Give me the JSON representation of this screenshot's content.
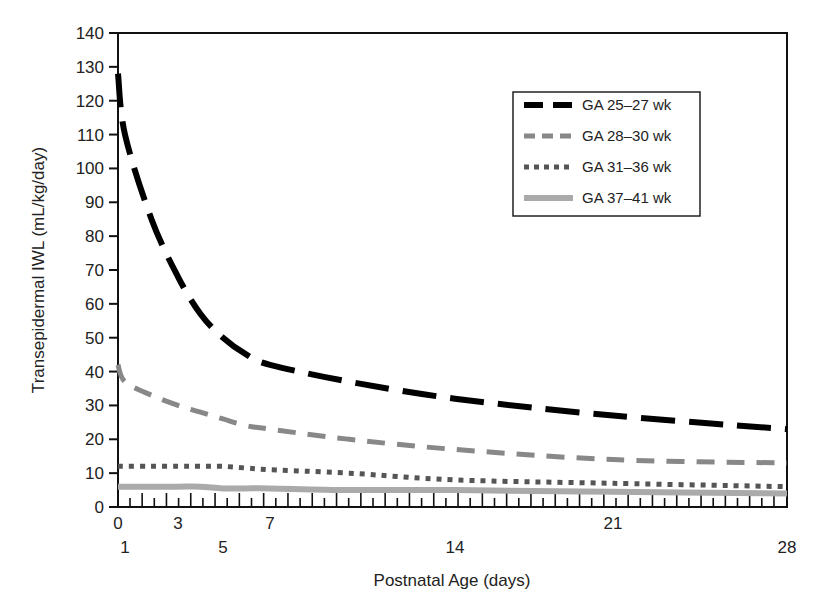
{
  "chart_data": {
    "type": "line",
    "title": "",
    "xlabel": "Postnatal Age (days)",
    "ylabel": "Transepidermal IWL (mL/kg/day)",
    "xlim": [
      0,
      28
    ],
    "ylim": [
      0,
      140
    ],
    "y_ticks": [
      0,
      10,
      20,
      30,
      40,
      50,
      60,
      70,
      80,
      90,
      100,
      110,
      120,
      130,
      140
    ],
    "x_tick_labels_row1": [
      "0",
      "3",
      "7",
      "21"
    ],
    "x_tick_labels_row2": [
      "1",
      "5",
      "14",
      "28"
    ],
    "x_tick_label_days_row1": [
      0,
      3,
      7,
      21
    ],
    "x_tick_label_days_row2": [
      1,
      5,
      14,
      28
    ],
    "grid": false,
    "legend_position": "upper right",
    "x": [
      0,
      1,
      2,
      3,
      4,
      5,
      6,
      7,
      10,
      14,
      21,
      28
    ],
    "series": [
      {
        "name": "GA 25–27 wk",
        "style": "long-dash",
        "color": "#000000",
        "values": [
          128,
          110,
          85,
          68,
          57,
          50,
          45,
          42,
          37,
          32,
          27,
          23
        ]
      },
      {
        "name": "GA 28–30 wk",
        "style": "dash",
        "color": "#888888",
        "values": [
          42,
          37,
          33,
          30,
          28,
          26,
          24,
          23,
          20,
          17,
          14,
          13
        ]
      },
      {
        "name": "GA 31–36 wk",
        "style": "dot",
        "color": "#555555",
        "values": [
          12,
          12,
          12,
          12,
          12,
          12,
          11.5,
          11,
          10,
          8,
          7,
          6
        ]
      },
      {
        "name": "GA 37–41 wk",
        "style": "solid",
        "color": "#aaaaaa",
        "values": [
          6,
          6,
          6,
          6,
          6,
          5.5,
          5.5,
          5.5,
          5,
          5,
          4.5,
          4
        ]
      }
    ]
  }
}
